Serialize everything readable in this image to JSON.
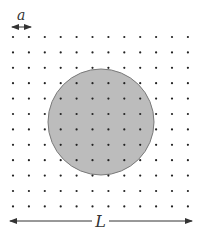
{
  "labels": {
    "spacing": "a",
    "length": "L"
  },
  "grid": {
    "columns": 12,
    "rows": 12,
    "x0": 13,
    "dx": 15.9,
    "y0": 37,
    "dy": 15.4,
    "dot_radius": 1.1,
    "dot_color": "#222222"
  },
  "circle": {
    "cx": 101,
    "cy": 122,
    "r": 53,
    "fill": "#bcbcbc",
    "stroke": "#7a7a7a"
  },
  "colors": {
    "arrow": "#333333"
  }
}
